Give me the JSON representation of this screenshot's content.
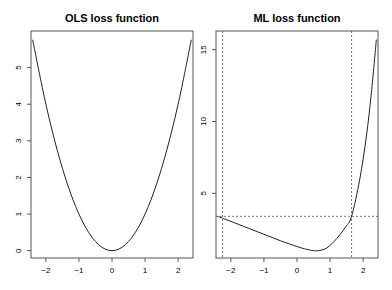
{
  "chart_data": [
    {
      "type": "line",
      "title": "OLS loss function",
      "xlabel": "",
      "ylabel": "",
      "xlim": [
        -2.45,
        2.45
      ],
      "ylim": [
        -0.2,
        6.0
      ],
      "xticks": [
        -2,
        -1,
        0,
        1,
        2
      ],
      "yticks": [
        0,
        1,
        2,
        3,
        4,
        5
      ],
      "grid": false,
      "x": [
        -2.4,
        -2.0,
        -1.6,
        -1.2,
        -0.8,
        -0.4,
        0.0,
        0.4,
        0.8,
        1.2,
        1.6,
        2.0,
        2.4
      ],
      "series": [
        {
          "name": "loss",
          "values": [
            5.76,
            4.0,
            2.56,
            1.44,
            0.64,
            0.16,
            0.0,
            0.16,
            0.64,
            1.44,
            2.56,
            4.0,
            5.76
          ]
        }
      ]
    },
    {
      "type": "line",
      "title": "ML loss function",
      "xlabel": "",
      "ylabel": "",
      "xlim": [
        -2.45,
        2.45
      ],
      "ylim": [
        0.5,
        16.3
      ],
      "xticks": [
        -2,
        -1,
        0,
        1,
        2
      ],
      "yticks": [
        5,
        10,
        15
      ],
      "grid": false,
      "x": [
        -2.4,
        -2.0,
        -1.5,
        -1.0,
        -0.5,
        0.0,
        0.3,
        0.6,
        0.9,
        1.2,
        1.45,
        1.65,
        1.9,
        2.1,
        2.25,
        2.4
      ],
      "series": [
        {
          "name": "loss",
          "values": [
            3.4,
            3.05,
            2.6,
            2.15,
            1.7,
            1.3,
            1.1,
            1.0,
            1.2,
            1.85,
            2.6,
            3.4,
            6.0,
            9.0,
            12.0,
            15.7
          ]
        }
      ],
      "reference_lines": {
        "vertical_dashed": [
          -2.25,
          1.65
        ],
        "horizontal_dashed": [
          3.4
        ]
      }
    }
  ]
}
